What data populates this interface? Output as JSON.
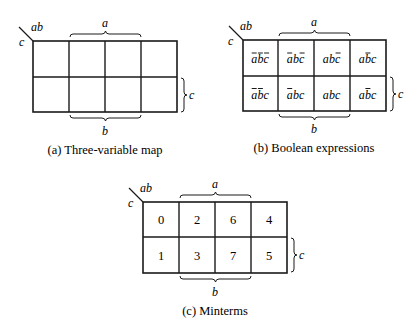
{
  "maps": [
    {
      "id": "a",
      "caption": "(a) Three-variable map",
      "corner_top": "ab",
      "corner_left": "c",
      "brace_top": "a",
      "brace_bottom": "b",
      "brace_right": "c",
      "cells": [
        [
          "",
          "",
          "",
          ""
        ],
        [
          "",
          "",
          "",
          ""
        ]
      ]
    },
    {
      "id": "b",
      "caption": "(b) Boolean expressions",
      "corner_top": "ab",
      "corner_left": "c",
      "brace_top": "a",
      "brace_bottom": "b",
      "brace_right": "c",
      "cells": [
        [
          {
            "letters": "abc",
            "overlines": [
              true,
              true,
              true
            ]
          },
          {
            "letters": "abc",
            "overlines": [
              true,
              false,
              true
            ]
          },
          {
            "letters": "abc",
            "overlines": [
              false,
              false,
              true
            ]
          },
          {
            "letters": "abc",
            "overlines": [
              false,
              true,
              false
            ]
          }
        ],
        [
          {
            "letters": "abc",
            "overlines": [
              true,
              true,
              false
            ]
          },
          {
            "letters": "abc",
            "overlines": [
              true,
              false,
              false
            ]
          },
          {
            "letters": "abc",
            "overlines": [
              false,
              false,
              false
            ]
          },
          {
            "letters": "abc",
            "overlines": [
              false,
              true,
              false
            ]
          }
        ]
      ]
    },
    {
      "id": "c",
      "caption": "(c) Minterms",
      "corner_top": "ab",
      "corner_left": "c",
      "brace_top": "a",
      "brace_bottom": "b",
      "brace_right": "c",
      "cells": [
        [
          "0",
          "2",
          "6",
          "4"
        ],
        [
          "1",
          "3",
          "7",
          "5"
        ]
      ]
    }
  ],
  "colors": {
    "ink": "#1a1a1a",
    "background": "#ffffff"
  }
}
